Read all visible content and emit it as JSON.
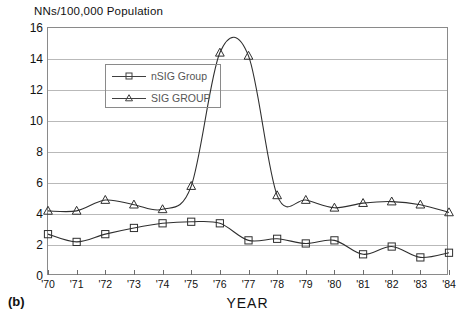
{
  "panel": {
    "label": "(b)"
  },
  "chart_data": {
    "type": "line",
    "title": "",
    "ylabel": "NNs/100,000 Population",
    "xlabel": "YEAR",
    "ylim": [
      0,
      16
    ],
    "ytick_values": [
      0,
      2,
      4,
      6,
      8,
      10,
      12,
      14,
      16
    ],
    "ytick_labels": [
      "0",
      "2",
      "4",
      "6",
      "8",
      "10",
      "12",
      "14",
      "16"
    ],
    "grid": true,
    "legend_position": "top-left",
    "categories": [
      "'70",
      "'71",
      "'72",
      "'73",
      "'74",
      "'75",
      "'76",
      "'77",
      "'78",
      "'79",
      "'80",
      "'81",
      "'82",
      "'83",
      "'84"
    ],
    "x": [
      1970,
      1971,
      1972,
      1973,
      1974,
      1975,
      1976,
      1977,
      1978,
      1979,
      1980,
      1981,
      1982,
      1983,
      1984
    ],
    "series": [
      {
        "name": "nSIG Group",
        "marker": "square",
        "values": [
          2.7,
          2.2,
          2.7,
          3.1,
          3.4,
          3.5,
          3.4,
          2.3,
          2.4,
          2.1,
          2.3,
          1.4,
          1.9,
          1.2,
          1.5
        ]
      },
      {
        "name": "SIG GROUP",
        "marker": "triangle",
        "values": [
          4.2,
          4.2,
          4.9,
          4.6,
          4.3,
          5.8,
          14.4,
          14.2,
          5.2,
          4.9,
          4.4,
          4.7,
          4.8,
          4.6,
          4.1
        ]
      }
    ]
  },
  "legend": {
    "entries": [
      {
        "label": "nSIG Group",
        "marker": "square-marker-icon"
      },
      {
        "label": "SIG GROUP",
        "marker": "triangle-marker-icon"
      }
    ]
  },
  "colors": {
    "line": "#2f2f2f",
    "grid": "#b9b9b9",
    "frame": "#8a8a8a",
    "text": "#111111",
    "legend_text": "#555555"
  }
}
